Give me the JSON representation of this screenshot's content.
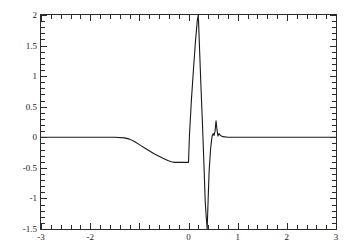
{
  "chart_data": {
    "type": "line",
    "title": "",
    "subtitle": "",
    "xlabel": "",
    "ylabel": "",
    "xlim": [
      -3,
      3
    ],
    "ylim": [
      -1.5,
      2
    ],
    "grid": false,
    "legend": null,
    "line_color": "#1a1a1a",
    "background": "#ffffff",
    "axis_color": "#2b2b2b",
    "xticks": [
      -3,
      -2,
      -1,
      0,
      1,
      2,
      3
    ],
    "xtick_labels": [
      "-3",
      "-2",
      "",
      "0",
      "1",
      "2",
      "3"
    ],
    "yticks": [
      -1.5,
      -1,
      -0.5,
      0,
      0.5,
      1,
      1.5,
      2
    ],
    "ytick_labels": [
      "-1.5",
      "-1",
      "-0.5",
      "0",
      "0.5",
      "1",
      "1.5",
      "2"
    ],
    "x_minor_tick_step": 0.2,
    "y_minor_tick_step": 0.1,
    "series": [
      {
        "name": "wavelet",
        "x": [
          -3.0,
          -2.6,
          -2.2,
          -1.8,
          -1.5,
          -1.3,
          -1.2,
          -1.1,
          -1.0,
          -0.9,
          -0.8,
          -0.7,
          -0.6,
          -0.5,
          -0.42,
          -0.35,
          -0.28,
          -0.2,
          -0.12,
          -0.06,
          -0.02,
          0.0,
          0.02,
          0.06,
          0.1,
          0.14,
          0.18,
          0.2,
          0.22,
          0.25,
          0.28,
          0.31,
          0.34,
          0.36,
          0.38,
          0.4,
          0.42,
          0.45,
          0.48,
          0.5,
          0.52,
          0.54,
          0.56,
          0.58,
          0.6,
          0.62,
          0.65,
          0.7,
          0.8,
          1.0,
          1.4,
          1.9,
          2.4,
          3.0
        ],
        "y": [
          0.0,
          0.0,
          0.0,
          0.0,
          0.0,
          -0.01,
          -0.03,
          -0.07,
          -0.12,
          -0.17,
          -0.22,
          -0.27,
          -0.31,
          -0.35,
          -0.38,
          -0.4,
          -0.41,
          -0.41,
          -0.41,
          -0.41,
          -0.41,
          -0.41,
          0.05,
          0.62,
          1.1,
          1.55,
          1.92,
          2.0,
          1.55,
          0.9,
          0.3,
          -0.35,
          -1.05,
          -1.3,
          -1.5,
          -1.0,
          -0.55,
          -0.18,
          0.02,
          0.06,
          0.03,
          0.1,
          0.27,
          0.12,
          0.02,
          0.06,
          0.03,
          0.01,
          0.0,
          0.0,
          0.0,
          0.0,
          0.0,
          0.0
        ],
        "color": "#1a1a1a",
        "width": 1.1
      }
    ],
    "annotations": []
  }
}
